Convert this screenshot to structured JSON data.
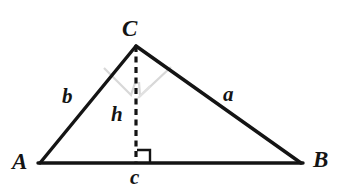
{
  "figure": {
    "kind": "triangle-with-altitude-diagram",
    "background_color": "#ffffff",
    "stroke_color": "#141414",
    "faint_mark_color": "#d8d8d8",
    "vertices": {
      "A": {
        "label": "A",
        "x": 40,
        "y": 163
      },
      "B": {
        "label": "B",
        "x": 301,
        "y": 163
      },
      "C": {
        "label": "C",
        "x": 136,
        "y": 46
      }
    },
    "foot_of_altitude": {
      "x": 136,
      "y": 163
    },
    "sides": {
      "a": {
        "label": "a",
        "from": "C",
        "to": "B"
      },
      "b": {
        "label": "b",
        "from": "A",
        "to": "C"
      },
      "c": {
        "label": "c",
        "from": "A",
        "to": "B"
      }
    },
    "altitude": {
      "label": "h",
      "style": "dashed",
      "from": "C",
      "to": "foot_of_altitude"
    },
    "right_angle_marker": {
      "name": "right-angle-at-foot",
      "size": 13,
      "side": "right-of-altitude"
    },
    "angle_marks": [
      {
        "name": "faint-angle-mark-left",
        "side": "left-of-altitude"
      },
      {
        "name": "faint-angle-mark-right",
        "side": "right-of-altitude"
      }
    ]
  },
  "labels": {
    "A": "A",
    "B": "B",
    "C": "C",
    "a": "a",
    "b": "b",
    "c": "c",
    "h": "h"
  }
}
